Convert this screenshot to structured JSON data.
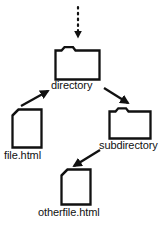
{
  "diagram": {
    "stroke_color": "#111111",
    "fill_color": "#ffffff",
    "background_color": "#ffffff",
    "nodes": [
      {
        "id": "directory",
        "label": "directory",
        "icon": "folder-icon"
      },
      {
        "id": "file",
        "label": "file.html",
        "icon": "file-icon"
      },
      {
        "id": "subdirectory",
        "label": "subdirectory",
        "icon": "folder-icon"
      },
      {
        "id": "otherfile",
        "label": "otherfile.html",
        "icon": "file-icon"
      }
    ],
    "edges": [
      {
        "id": "parent-to-directory",
        "from": "parent",
        "to": "directory",
        "style": "dotted",
        "arrow": "down"
      },
      {
        "id": "file-to-directory",
        "from": "file",
        "to": "directory",
        "style": "solid",
        "arrow": "up-right"
      },
      {
        "id": "directory-to-subdir",
        "from": "directory",
        "to": "subdirectory",
        "style": "solid",
        "arrow": "down-right"
      },
      {
        "id": "subdir-to-otherfile",
        "from": "subdirectory",
        "to": "otherfile",
        "style": "solid",
        "arrow": "down-left"
      }
    ]
  }
}
